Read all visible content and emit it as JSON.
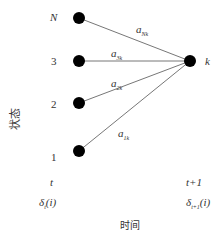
{
  "diagram": {
    "y_axis_label": "状态",
    "x_axis_label": "时间",
    "left_nodes": [
      {
        "label": "N",
        "y": 18
      },
      {
        "label": "3",
        "y": 61
      },
      {
        "label": "2",
        "y": 103
      },
      {
        "label": "1",
        "y": 151
      }
    ],
    "right_node": {
      "label": "k",
      "x": 190,
      "y": 61
    },
    "edges": [
      {
        "from": "N",
        "to": "k",
        "label_main": "a",
        "label_sub": "Nk"
      },
      {
        "from": "3",
        "to": "k",
        "label_main": "a",
        "label_sub": "3k"
      },
      {
        "from": "2",
        "to": "k",
        "label_main": "a",
        "label_sub": "2k"
      },
      {
        "from": "1",
        "to": "k",
        "label_main": "a",
        "label_sub": "1k"
      }
    ],
    "time_left": "t",
    "time_right": "t+1",
    "delta_left": {
      "main": "δ",
      "sub": "t",
      "arg": "(i)"
    },
    "delta_right": {
      "main": "δ",
      "sub": "t+1",
      "arg": "(i)"
    },
    "colors": {
      "node": "#000000",
      "edge": "#777777",
      "text": "#333333"
    }
  }
}
